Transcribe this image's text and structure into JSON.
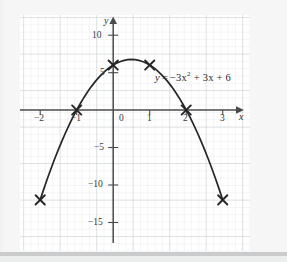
{
  "figure": {
    "equation_label": "y = −3x² + 3x + 6",
    "equation_parts": {
      "lhs": "y",
      "equals": "=",
      "term1": "−3x",
      "exponent": "2",
      "term2": "+ 3x",
      "term3": "+ 6"
    },
    "axis_labels": {
      "x": "x",
      "y": "y"
    },
    "colors": {
      "curve": "#262626",
      "axis": "#4a4a4a",
      "grid_minor": "#dfe3e6",
      "grid_major": "#c3c9cd",
      "plot_background": "#ffffff",
      "page_background": "#f6f6f6",
      "text": "#2b2b2b"
    }
  },
  "chart_data": {
    "type": "line",
    "title": "",
    "subtitle": "",
    "xlabel": "x",
    "ylabel": "y",
    "equation": "y = -3x^2 + 3x + 6",
    "curve_expression": "-3*x^2 + 3*x + 6",
    "xlim": [
      -2.45,
      3.3
    ],
    "ylim": [
      -17.2,
      12.2
    ],
    "grid": true,
    "grid_minor_step": 1,
    "grid_major_step": 5,
    "legend": "none",
    "x_ticks": [
      -2,
      -1,
      0,
      1,
      2,
      3
    ],
    "x_tick_labels": [
      "−2",
      "−1",
      "0",
      "1",
      "2",
      "3"
    ],
    "y_ticks": [
      10,
      5,
      -5,
      -10,
      -15
    ],
    "y_tick_labels": [
      "10",
      "5",
      "−5",
      "−10",
      "−15"
    ],
    "marked_points": [
      {
        "x": -2,
        "y": -12,
        "marker": "x"
      },
      {
        "x": -1,
        "y": 0,
        "marker": "x"
      },
      {
        "x": 0,
        "y": 6,
        "marker": "x"
      },
      {
        "x": 1,
        "y": 6,
        "marker": "x"
      },
      {
        "x": 2,
        "y": 0,
        "marker": "x"
      },
      {
        "x": 3,
        "y": -12,
        "marker": "x"
      }
    ],
    "vertex": {
      "x": 0.5,
      "y": 6.75
    },
    "roots": [
      -1,
      2
    ],
    "y_intercept": 6,
    "series": [
      {
        "name": "y = -3x^2 + 3x + 6",
        "x": [
          -2.0,
          -1.9,
          -1.8,
          -1.7,
          -1.6,
          -1.5,
          -1.4,
          -1.3,
          -1.2,
          -1.1,
          -1.0,
          -0.9,
          -0.8,
          -0.7,
          -0.6,
          -0.5,
          -0.4,
          -0.3,
          -0.2,
          -0.1,
          0.0,
          0.1,
          0.2,
          0.3,
          0.4,
          0.5,
          0.6,
          0.7,
          0.8,
          0.9,
          1.0,
          1.1,
          1.2,
          1.3,
          1.4,
          1.5,
          1.6,
          1.7,
          1.8,
          1.9,
          2.0,
          2.1,
          2.2,
          2.3,
          2.4,
          2.5,
          2.6,
          2.7,
          2.8,
          2.9,
          3.0
        ],
        "y": [
          -12.0,
          -10.53,
          -9.12,
          -7.77,
          -6.48,
          -5.25,
          -4.08,
          -2.97,
          -1.92,
          -0.93,
          0.0,
          0.87,
          1.68,
          2.43,
          3.12,
          3.75,
          4.32,
          4.83,
          5.28,
          5.67,
          6.0,
          6.27,
          6.48,
          6.63,
          6.72,
          6.75,
          6.72,
          6.63,
          6.48,
          6.27,
          6.0,
          5.67,
          5.28,
          4.83,
          4.32,
          3.75,
          3.12,
          2.43,
          1.68,
          0.87,
          0.0,
          -0.93,
          -1.92,
          -2.97,
          -4.08,
          -5.25,
          -6.48,
          -7.77,
          -9.12,
          -10.53,
          -12.0
        ]
      }
    ]
  }
}
